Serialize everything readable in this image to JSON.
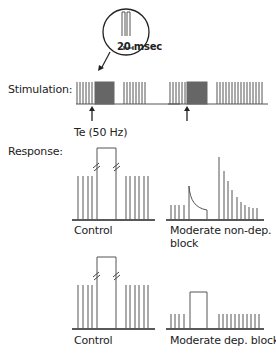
{
  "labels": {
    "stimulation": "Stimulation:",
    "response": "Response:",
    "tetanus": "Te (50 Hz)",
    "inset_scale": "20 msec"
  },
  "panels": [
    {
      "id": "control-top",
      "caption_lines": [
        "Control"
      ]
    },
    {
      "id": "moderate-non-dep",
      "caption_lines": [
        "Moderate non-dep.",
        "block"
      ]
    },
    {
      "id": "control-bottom",
      "caption_lines": [
        "Control"
      ]
    },
    {
      "id": "moderate-dep",
      "caption_lines": [
        "Moderate dep. block"
      ]
    }
  ],
  "colors": {
    "line": "#555555",
    "tetanus_fill": "#666666",
    "text": "#222222"
  }
}
